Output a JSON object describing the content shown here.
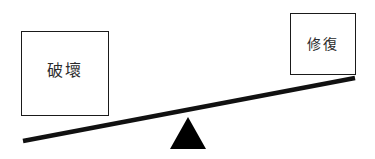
{
  "diagram": {
    "type": "balance-scale-seesaw",
    "background_color": "#ffffff",
    "beam": {
      "name": "lever-beam",
      "color": "#111111",
      "thickness_px": 4,
      "left_end": {
        "x": 23,
        "y": 141
      },
      "right_end": {
        "x": 355,
        "y": 78
      },
      "tilt": "left side down, right side up"
    },
    "fulcrum": {
      "name": "triangle-fulcrum",
      "color": "#000000",
      "apex": {
        "x": 188,
        "y": 117
      },
      "base_left": {
        "x": 170,
        "y": 149
      },
      "base_right": {
        "x": 206,
        "y": 149
      }
    },
    "left_pan": {
      "label": "破壞",
      "position": "low",
      "border_color": "#1a1a1a",
      "fill_color": "#ffffff"
    },
    "right_pan": {
      "label": "修復",
      "position": "high",
      "border_color": "#1a1a1a",
      "fill_color": "#ffffff"
    }
  }
}
